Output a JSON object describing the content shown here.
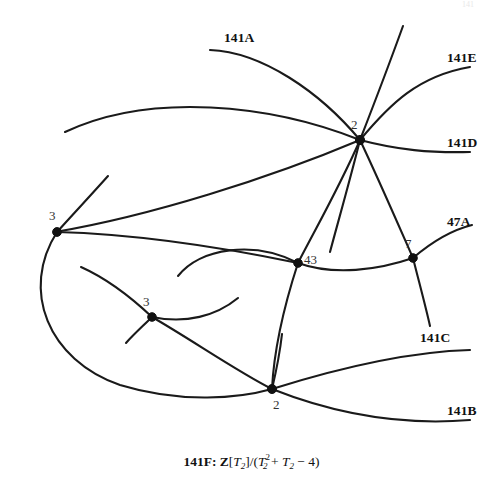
{
  "figure": {
    "width": 503,
    "height": 493,
    "background": "#ffffff",
    "stroke_color": "#1a1a1a",
    "node_color": "#111111"
  },
  "caption": {
    "id": "141F:",
    "ring": "Z",
    "gen_open": "[",
    "gen": "T",
    "gen_sub": "2",
    "gen_close": "]",
    "slash": "/(",
    "poly_var": "T",
    "poly_sub": "2",
    "poly_sup": "2",
    "poly_plus": " + ",
    "poly_var2": "T",
    "poly_sub2": "2",
    "poly_tail": " − 4)",
    "full_text": "141F: Z[T2]/(T2^2 + T2 - 4)"
  },
  "branch_labels": [
    {
      "name": "141A",
      "text": "141A",
      "x": 224,
      "y": 31
    },
    {
      "name": "141E",
      "text": "141E",
      "x": 447,
      "y": 51
    },
    {
      "name": "141D",
      "text": "141D",
      "x": 447,
      "y": 136
    },
    {
      "name": "47A",
      "text": "47A",
      "x": 447,
      "y": 215
    },
    {
      "name": "141C",
      "text": "141C",
      "x": 420,
      "y": 331
    },
    {
      "name": "141B",
      "text": "141B",
      "x": 447,
      "y": 404
    }
  ],
  "nodes": [
    {
      "name": "node-central-2",
      "multiplicity": "2",
      "cx": 360,
      "cy": 140,
      "label_x": 351,
      "label_y": 118,
      "radius": 4.6
    },
    {
      "name": "node-left-3",
      "multiplicity": "3",
      "cx": 57,
      "cy": 232,
      "label_x": 49,
      "label_y": 209,
      "radius": 4.4
    },
    {
      "name": "node-mid-43",
      "multiplicity": "43",
      "cx": 298,
      "cy": 263,
      "label_x": 304,
      "label_y": 253,
      "radius": 4.3
    },
    {
      "name": "node-right-7",
      "multiplicity": "7",
      "cx": 413,
      "cy": 258,
      "label_x": 405,
      "label_y": 237,
      "radius": 4.3
    },
    {
      "name": "node-lower-3",
      "multiplicity": "3",
      "cx": 152,
      "cy": 317,
      "label_x": 143,
      "label_y": 295,
      "radius": 4.3
    },
    {
      "name": "node-bottom-2",
      "multiplicity": "2",
      "cx": 272,
      "cy": 389,
      "label_x": 273,
      "label_y": 398,
      "radius": 4.5
    }
  ],
  "curves": [
    {
      "name": "curve-141A",
      "d": "M 210 50 C 262 52 320 92 360 140"
    },
    {
      "name": "curve-141E",
      "d": "M 360 140 C 390 104 418 76 470 67"
    },
    {
      "name": "curve-141D",
      "d": "M 360 140 C 398 150 430 153 470 152"
    },
    {
      "name": "curve-long-top-arc",
      "d": "M 65 132 C 150 92 270 104 360 140"
    },
    {
      "name": "curve-central-to-left-sweep",
      "d": "M 360 140 C 270 178 150 216 55 232"
    },
    {
      "name": "curve-central-to-43",
      "d": "M 360 140 C 340 186 316 228 298 263"
    },
    {
      "name": "curve-central-to-7",
      "d": "M 360 140 C 378 178 398 224 413 258"
    },
    {
      "name": "curve-central-up-right",
      "d": "M 360 140 C 374 104 390 62 403 26"
    },
    {
      "name": "curve-central-down-left-steep",
      "d": "M 360 140 C 350 180 338 222 330 252"
    },
    {
      "name": "curve-47A",
      "d": "M 413 258 C 434 240 452 230 472 225"
    },
    {
      "name": "curve-7-down-right",
      "d": "M 413 258 C 419 282 425 304 430 326"
    },
    {
      "name": "curve-43-to-7",
      "d": "M 298 263 C 334 276 378 270 413 258"
    },
    {
      "name": "curve-43-left-hump",
      "d": "M 298 263 C 254 240 200 248 178 276"
    },
    {
      "name": "curve-43-to-bottom2",
      "d": "M 298 263 C 286 300 274 348 272 389"
    },
    {
      "name": "curve-left3-up",
      "d": "M 57 232 C 75 212 92 194 108 176"
    },
    {
      "name": "curve-left3-big-sweep",
      "d": "M 57 232 C 20 290 48 360 120 385 C 182 404 240 398 272 389"
    },
    {
      "name": "curve-left3-to-43-line",
      "d": "M 57 232 C 130 234 216 246 298 263"
    },
    {
      "name": "curve-lower3-hook",
      "d": "M 81 267 C 110 280 134 300 152 317"
    },
    {
      "name": "curve-lower3-down-left",
      "d": "M 152 317 C 143 326 134 334 126 343"
    },
    {
      "name": "curve-lower3-to-bottom2",
      "d": "M 152 317 C 192 340 238 372 272 389"
    },
    {
      "name": "curve-lower3-right-hump",
      "d": "M 152 317 C 186 324 216 316 238 298"
    },
    {
      "name": "curve-bottom2-141C",
      "d": "M 272 389 C 326 372 400 352 470 350"
    },
    {
      "name": "curve-bottom2-141B",
      "d": "M 272 389 C 330 412 398 426 470 420"
    },
    {
      "name": "curve-bottom2-up-line",
      "d": "M 272 389 C 276 372 280 352 282 334"
    }
  ],
  "top_artifact": {
    "name": "page-artifact",
    "text": "141"
  }
}
